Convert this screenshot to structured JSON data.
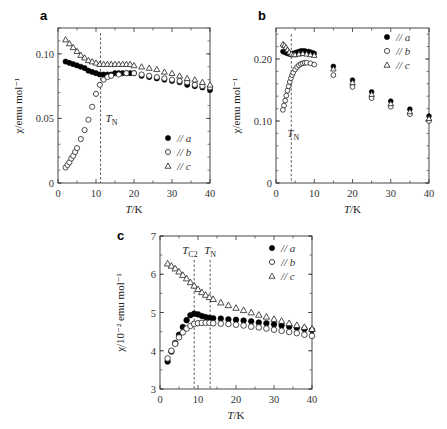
{
  "chart_data": [
    {
      "panel": "a",
      "type": "scatter",
      "xlabel": "T/K",
      "ylabel": "χ/emu mol⁻¹",
      "xlim": [
        0,
        40
      ],
      "ylim": [
        0,
        0.12
      ],
      "xticks": [
        0,
        10,
        20,
        30,
        40
      ],
      "yticks": [
        0,
        0.05,
        0.1
      ],
      "ytick_labels": [
        "0",
        "0.05",
        "0.10"
      ],
      "annotations": [
        {
          "text": "T_N",
          "x": 11.2
        }
      ],
      "legend": [
        "// a",
        "// b",
        "// c"
      ],
      "legend_position": "lower right",
      "series": [
        {
          "name": "// a",
          "marker": "filled-circle",
          "x": [
            2,
            3,
            4,
            5,
            6,
            7,
            8,
            9,
            10,
            11,
            12,
            13,
            14,
            15,
            16,
            17,
            18,
            19,
            20,
            22,
            24,
            26,
            28,
            30,
            32,
            34,
            36,
            38,
            40
          ],
          "y": [
            0.094,
            0.093,
            0.092,
            0.091,
            0.09,
            0.089,
            0.087,
            0.086,
            0.085,
            0.084,
            0.084,
            0.084,
            0.084,
            0.085,
            0.085,
            0.085,
            0.085,
            0.085,
            0.085,
            0.083,
            0.082,
            0.081,
            0.08,
            0.079,
            0.078,
            0.076,
            0.075,
            0.074,
            0.072
          ]
        },
        {
          "name": "// b",
          "marker": "open-circle",
          "x": [
            2,
            2.5,
            3,
            3.5,
            4,
            4.5,
            5,
            6,
            7,
            8,
            9,
            10,
            11,
            12,
            13,
            14,
            16,
            18,
            20,
            22,
            24,
            26,
            28,
            30,
            32,
            34,
            36,
            38,
            40
          ],
          "y": [
            0.012,
            0.014,
            0.016,
            0.019,
            0.021,
            0.024,
            0.027,
            0.034,
            0.041,
            0.049,
            0.059,
            0.069,
            0.076,
            0.08,
            0.082,
            0.083,
            0.084,
            0.085,
            0.085,
            0.084,
            0.083,
            0.082,
            0.081,
            0.08,
            0.079,
            0.078,
            0.076,
            0.075,
            0.074
          ]
        },
        {
          "name": "// c",
          "marker": "open-triangle",
          "x": [
            2,
            3,
            4,
            5,
            6,
            7,
            8,
            9,
            10,
            11,
            12,
            13,
            14,
            15,
            16,
            17,
            18,
            19,
            20,
            22,
            24,
            26,
            28,
            30,
            32,
            34,
            36,
            38,
            40
          ],
          "y": [
            0.111,
            0.108,
            0.105,
            0.102,
            0.099,
            0.097,
            0.095,
            0.094,
            0.093,
            0.092,
            0.092,
            0.092,
            0.092,
            0.092,
            0.092,
            0.092,
            0.092,
            0.092,
            0.091,
            0.09,
            0.089,
            0.088,
            0.086,
            0.085,
            0.083,
            0.081,
            0.08,
            0.078,
            0.076
          ]
        }
      ]
    },
    {
      "panel": "b",
      "type": "scatter",
      "xlabel": "T/K",
      "ylabel": "χ/emu mol⁻¹",
      "xlim": [
        0,
        40
      ],
      "ylim": [
        0,
        0.25
      ],
      "xticks": [
        0,
        10,
        20,
        30,
        40
      ],
      "yticks": [
        0,
        0.1,
        0.2
      ],
      "ytick_labels": [
        "0",
        "0.10",
        "0.20"
      ],
      "annotations": [
        {
          "text": "T_N",
          "x": 4.0
        }
      ],
      "legend": [
        "// a",
        "// b",
        "// c"
      ],
      "legend_position": "upper right",
      "series": [
        {
          "name": "// a",
          "marker": "filled-circle",
          "x": [
            1.8,
            2.2,
            2.6,
            3,
            3.5,
            4,
            4.5,
            5,
            5.5,
            6,
            6.5,
            7,
            7.5,
            8,
            8.5,
            9,
            9.5,
            10,
            15,
            20,
            25,
            30,
            35,
            40
          ],
          "y": [
            0.212,
            0.211,
            0.21,
            0.209,
            0.208,
            0.208,
            0.209,
            0.21,
            0.211,
            0.212,
            0.213,
            0.213,
            0.213,
            0.212,
            0.212,
            0.211,
            0.21,
            0.209,
            0.188,
            0.166,
            0.147,
            0.132,
            0.119,
            0.108
          ]
        },
        {
          "name": "// b",
          "marker": "open-circle",
          "x": [
            1.8,
            2.1,
            2.4,
            2.7,
            3,
            3.3,
            3.6,
            3.9,
            4.2,
            4.5,
            5,
            5.5,
            6,
            6.5,
            7,
            7.5,
            8,
            9,
            10,
            15,
            20,
            25,
            30,
            35,
            40
          ],
          "y": [
            0.118,
            0.125,
            0.133,
            0.141,
            0.149,
            0.156,
            0.163,
            0.169,
            0.174,
            0.178,
            0.183,
            0.187,
            0.19,
            0.192,
            0.193,
            0.194,
            0.194,
            0.193,
            0.191,
            0.174,
            0.155,
            0.137,
            0.123,
            0.111,
            0.1
          ]
        },
        {
          "name": "// c",
          "marker": "open-triangle",
          "x": [
            1.8,
            2.2,
            2.6,
            3,
            3.5,
            4,
            4.5,
            5,
            6,
            7,
            8,
            9,
            10,
            15,
            20,
            25,
            30,
            35,
            40
          ],
          "y": [
            0.224,
            0.222,
            0.219,
            0.215,
            0.211,
            0.208,
            0.207,
            0.207,
            0.208,
            0.209,
            0.208,
            0.207,
            0.206,
            0.184,
            0.162,
            0.143,
            0.128,
            0.115,
            0.104
          ]
        }
      ]
    },
    {
      "panel": "c",
      "type": "scatter",
      "xlabel": "T/K",
      "ylabel": "χ/10⁻² emu mol⁻¹",
      "xlim": [
        0,
        40
      ],
      "ylim": [
        3,
        7
      ],
      "xticks": [
        0,
        10,
        20,
        30,
        40
      ],
      "yticks": [
        3,
        4,
        5,
        6,
        7
      ],
      "ytick_labels": [
        "3",
        "4",
        "5",
        "6",
        "7"
      ],
      "annotations": [
        {
          "text": "T_C2",
          "x": 9.0
        },
        {
          "text": "T_N",
          "x": 13.2
        }
      ],
      "legend": [
        "// a",
        "// b",
        "// c"
      ],
      "legend_position": "upper right",
      "series": [
        {
          "name": "// a",
          "marker": "filled-circle",
          "x": [
            2,
            3,
            4,
            5,
            6,
            7,
            8,
            9,
            10,
            11,
            12,
            13,
            14,
            16,
            18,
            20,
            22,
            24,
            26,
            28,
            30,
            32,
            34,
            36,
            38,
            40
          ],
          "y": [
            3.72,
            3.98,
            4.2,
            4.42,
            4.62,
            4.8,
            4.93,
            4.97,
            4.95,
            4.91,
            4.88,
            4.86,
            4.85,
            4.84,
            4.82,
            4.81,
            4.79,
            4.77,
            4.74,
            4.72,
            4.69,
            4.66,
            4.63,
            4.6,
            4.57,
            4.54
          ]
        },
        {
          "name": "// b",
          "marker": "open-circle",
          "x": [
            2,
            3,
            4,
            5,
            6,
            7,
            8,
            9,
            10,
            11,
            12,
            13,
            14,
            16,
            18,
            20,
            22,
            24,
            26,
            28,
            30,
            32,
            34,
            36,
            38,
            40
          ],
          "y": [
            3.8,
            4.0,
            4.18,
            4.35,
            4.48,
            4.58,
            4.65,
            4.7,
            4.72,
            4.73,
            4.73,
            4.73,
            4.72,
            4.71,
            4.7,
            4.68,
            4.66,
            4.63,
            4.61,
            4.58,
            4.55,
            4.52,
            4.49,
            4.46,
            4.42,
            4.39
          ]
        },
        {
          "name": "// c",
          "marker": "open-triangle",
          "x": [
            2,
            3,
            4,
            5,
            6,
            7,
            8,
            9,
            10,
            11,
            12,
            13,
            14,
            16,
            18,
            20,
            22,
            24,
            26,
            28,
            30,
            32,
            34,
            36,
            38,
            40
          ],
          "y": [
            6.28,
            6.22,
            6.15,
            6.07,
            5.98,
            5.89,
            5.79,
            5.7,
            5.61,
            5.53,
            5.46,
            5.4,
            5.35,
            5.26,
            5.19,
            5.12,
            5.06,
            5.0,
            4.94,
            4.89,
            4.83,
            4.78,
            4.72,
            4.67,
            4.62,
            4.57
          ]
        }
      ]
    }
  ],
  "panels": {
    "a": {
      "letter": "a",
      "xlabel_italic": "T",
      "xlabel_rest": "/K",
      "ylabel": "χ/emu mol⁻¹",
      "tn_label": "T",
      "tn_sub": "N"
    },
    "b": {
      "letter": "b",
      "xlabel_italic": "T",
      "xlabel_rest": "/K",
      "ylabel": "χ/emu mol⁻¹",
      "tn_label": "T",
      "tn_sub": "N"
    },
    "c": {
      "letter": "c",
      "xlabel_italic": "T",
      "xlabel_rest": "/K",
      "ylabel": "χ/10⁻² emu mol⁻¹",
      "tc2_label": "T",
      "tc2_sub": "C2",
      "tn_label": "T",
      "tn_sub": "N"
    }
  },
  "legend_labels": [
    "// a",
    "// b",
    "// c"
  ]
}
